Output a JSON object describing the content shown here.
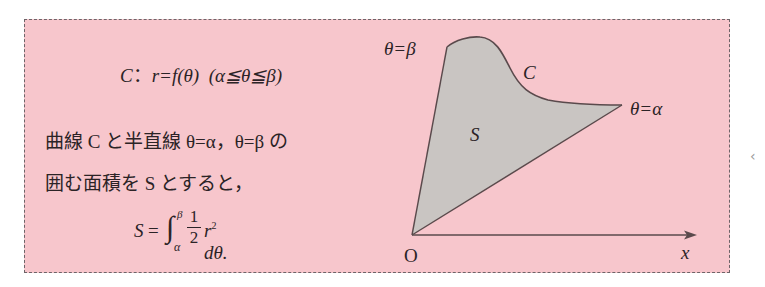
{
  "definition": {
    "curve_name": "C",
    "colon": "：",
    "equation": "r=f(θ)",
    "range": "(α≦θ≦β)"
  },
  "description": {
    "line1": "曲線 C と半直線 θ=α，θ=β の",
    "line2": "囲む面積を S とすると，"
  },
  "formula": {
    "lhs": "S",
    "equals": "=",
    "integral": "∫",
    "upper_limit": "β",
    "lower_limit": "α",
    "fraction_numerator": "1",
    "fraction_denominator": "2",
    "integrand": "r",
    "exponent": "2",
    "differential": " dθ."
  },
  "diagram": {
    "label_beta": "θ=β",
    "label_alpha": "θ=α",
    "label_curve": "C",
    "label_area": "S",
    "label_origin": "O",
    "label_x_axis": "x",
    "colors": {
      "background": "#f7c6cc",
      "region_fill": "#c9c5c2",
      "stroke": "#5a4a4c"
    }
  },
  "side_control": {
    "glyph": "‹"
  }
}
